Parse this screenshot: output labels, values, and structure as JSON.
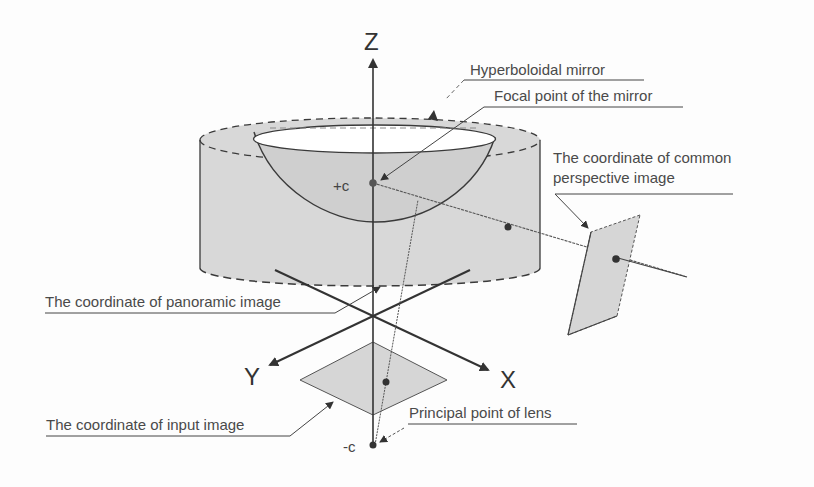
{
  "diagram": {
    "type": "omnidirectional camera geometry (hyperboloidal mirror projection)",
    "axes": {
      "z": "Z",
      "x": "X",
      "y": "Y"
    },
    "points": {
      "upper_focus": "+c",
      "lower_focus": "-c"
    },
    "labels": {
      "hyperboloidal_mirror": "Hyperboloidal mirror",
      "focal_point": "Focal point of the mirror",
      "common_perspective_line1": "The coordinate of common",
      "common_perspective_line2": "perspective image",
      "panoramic_image": "The coordinate of panoramic image",
      "input_image": "The coordinate of input image",
      "principal_point": "Principal point of lens"
    },
    "colors": {
      "line": "#3a3a3a",
      "fill_gray": "#d6d6d6",
      "text": "#4a4a4a",
      "background": "#fdfdfd"
    }
  }
}
